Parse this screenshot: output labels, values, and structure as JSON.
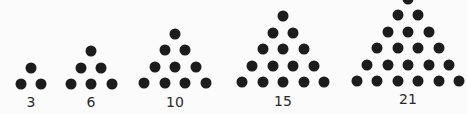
{
  "diagram": {
    "dot_color": "#1c1c1c",
    "background": "#fbfbfb",
    "groups": [
      {
        "label": "3",
        "rows": 2,
        "apex_x": 31,
        "bottom_y": 84,
        "label_y": 102
      },
      {
        "label": "6",
        "rows": 3,
        "apex_x": 91,
        "bottom_y": 84,
        "label_y": 102
      },
      {
        "label": "10",
        "rows": 4,
        "apex_x": 175,
        "bottom_y": 83,
        "label_y": 102
      },
      {
        "label": "15",
        "rows": 5,
        "apex_x": 283,
        "bottom_y": 82,
        "label_y": 101
      },
      {
        "label": "21",
        "rows": 6,
        "apex_x": 408,
        "bottom_y": 81,
        "label_y": 99
      }
    ],
    "spacing": {
      "dx": 20.5,
      "dy": 16.5
    }
  }
}
